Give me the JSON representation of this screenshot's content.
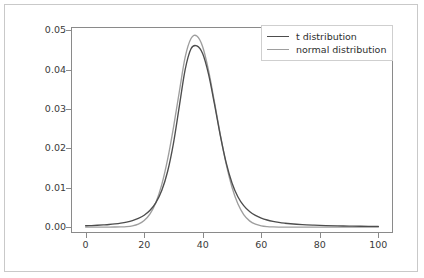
{
  "chart_data": {
    "type": "line",
    "title": "",
    "xlabel": "",
    "ylabel": "",
    "xlim": [
      -5,
      105
    ],
    "ylim": [
      -0.0015,
      0.0508
    ],
    "grid": false,
    "legend_position": "upper right",
    "xticks": [
      "0",
      "20",
      "40",
      "60",
      "80",
      "100"
    ],
    "xtick_values": [
      0,
      20,
      40,
      60,
      80,
      100
    ],
    "yticks": [
      "0.00",
      "0.01",
      "0.02",
      "0.03",
      "0.04",
      "0.05"
    ],
    "ytick_values": [
      0.0,
      0.01,
      0.02,
      0.03,
      0.04,
      0.05
    ],
    "series": [
      {
        "name": "t distribution",
        "color": "#4d4d4d",
        "peak_x": 38,
        "peak_y": 0.046,
        "x": [
          0,
          2,
          4,
          6,
          8,
          10,
          12,
          14,
          16,
          18,
          20,
          22,
          24,
          26,
          28,
          30,
          32,
          34,
          36,
          38,
          40,
          42,
          44,
          46,
          48,
          50,
          52,
          54,
          56,
          58,
          60,
          62,
          64,
          66,
          68,
          70,
          74,
          78,
          82,
          86,
          90,
          94,
          100
        ],
        "y": [
          0.00033,
          0.00039,
          0.00046,
          0.00055,
          0.00066,
          0.00081,
          0.00101,
          0.00128,
          0.00166,
          0.00221,
          0.00302,
          0.00427,
          0.00622,
          0.0093,
          0.01412,
          0.02128,
          0.03065,
          0.03997,
          0.04527,
          0.046,
          0.04399,
          0.03876,
          0.03128,
          0.02326,
          0.01635,
          0.0112,
          0.0077,
          0.00543,
          0.00395,
          0.00296,
          0.00228,
          0.0018,
          0.00145,
          0.00119,
          0.00099,
          0.00084,
          0.00062,
          0.00048,
          0.00038,
          0.00031,
          0.00025,
          0.00021,
          0.00017
        ]
      },
      {
        "name": "normal distribution",
        "color": "#9e9e9e",
        "peak_x": 38,
        "peak_y": 0.0485,
        "x": [
          0,
          2,
          4,
          6,
          8,
          10,
          12,
          14,
          16,
          18,
          20,
          22,
          24,
          26,
          28,
          30,
          32,
          34,
          36,
          38,
          40,
          42,
          44,
          46,
          48,
          50,
          52,
          54,
          56,
          58,
          60,
          62,
          64,
          66,
          68,
          70,
          74,
          78,
          82,
          86,
          90,
          94,
          100
        ],
        "y": [
          0.0,
          0.0,
          0.0,
          0.0,
          1e-05,
          2e-05,
          5e-05,
          0.00013,
          0.00033,
          0.00077,
          0.00167,
          0.00336,
          0.00626,
          0.01078,
          0.01717,
          0.02527,
          0.03436,
          0.04313,
          0.04787,
          0.0485,
          0.04573,
          0.03972,
          0.03177,
          0.02349,
          0.01604,
          0.01012,
          0.0059,
          0.00318,
          0.00158,
          0.00073,
          0.00031,
          0.00012,
          4e-05,
          1e-05,
          0.0,
          0.0,
          0.0,
          0.0,
          0.0,
          0.0,
          0.0,
          0.0,
          0.0
        ]
      }
    ]
  },
  "legend": {
    "entries": [
      {
        "label": "t distribution",
        "color": "#4d4d4d"
      },
      {
        "label": "normal distribution",
        "color": "#9e9e9e"
      }
    ]
  },
  "axes": {
    "frame_color": "#8a8a8a",
    "tick_label_color": "#3a3a3a"
  },
  "figure": {
    "background": "#ffffff",
    "border_color": "#c9c9c9"
  }
}
